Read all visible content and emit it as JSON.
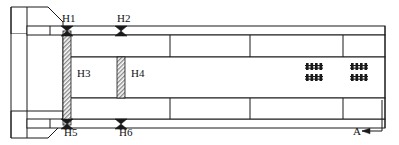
{
  "drawing": {
    "title": "Structural plan view with hinge locations",
    "background_color": "#ffffff",
    "line_color": "#1a1a1a",
    "hatch_color": "#8c8c8c",
    "canvas": {
      "width": 399,
      "height": 145
    },
    "labels": [
      {
        "id": "H1",
        "text": "H1",
        "x": 62,
        "y": 22
      },
      {
        "id": "H2",
        "text": "H2",
        "x": 117,
        "y": 22
      },
      {
        "id": "H3",
        "text": "H3",
        "x": 77,
        "y": 77
      },
      {
        "id": "H4",
        "text": "H4",
        "x": 131,
        "y": 77
      },
      {
        "id": "H5",
        "text": "H5",
        "x": 64,
        "y": 136
      },
      {
        "id": "H6",
        "text": "H6",
        "x": 119,
        "y": 136
      },
      {
        "id": "A",
        "text": "A",
        "x": 353,
        "y": 133
      }
    ],
    "hinge_markers": [
      {
        "id": "H1",
        "cx": 67,
        "cy": 31
      },
      {
        "id": "H2",
        "cx": 121,
        "cy": 31
      },
      {
        "id": "H5",
        "cx": 67,
        "cy": 124
      },
      {
        "id": "H6",
        "cx": 121,
        "cy": 124
      }
    ],
    "hatched_columns": [
      {
        "id": "H3-column",
        "x": 63,
        "y": 31,
        "width": 8,
        "height": 94
      },
      {
        "id": "H4-column",
        "x": 117,
        "y": 57,
        "width": 8,
        "height": 41
      }
    ],
    "reinforcement_groups": [
      {
        "id": "rebar-group-1",
        "x": 306,
        "y": 63,
        "bars": 4
      },
      {
        "id": "rebar-group-2",
        "x": 306,
        "y": 74,
        "bars": 4
      },
      {
        "id": "rebar-group-3",
        "x": 351,
        "y": 63,
        "bars": 4
      },
      {
        "id": "rebar-group-4",
        "x": 351,
        "y": 74,
        "bars": 4
      }
    ],
    "section_marker": {
      "id": "section-A",
      "label": "A",
      "arrow_direction": "left",
      "leader_x": 382,
      "leader_top_y": 100,
      "leader_bottom_y": 131,
      "arrow_tip_x": 362
    }
  }
}
